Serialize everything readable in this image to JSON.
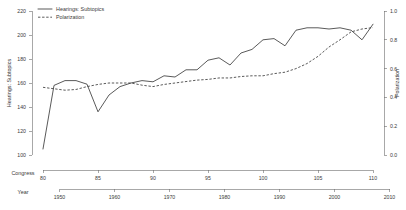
{
  "chart_data": {
    "type": "line",
    "title": "",
    "subtitle": "",
    "grid": false,
    "legend_position": "top-left",
    "xlabel": "Congress",
    "xlabel_secondary": "Year",
    "ylabel": "Hearings: Subtopics",
    "ylabel_secondary": "Polarization",
    "xlim": [
      79,
      110.5
    ],
    "xlim_secondary": [
      1946,
      2010.5
    ],
    "ylim": [
      100,
      220
    ],
    "ylim_secondary": [
      0.0,
      1.0
    ],
    "xticks": [
      80,
      85,
      90,
      95,
      100,
      105,
      110
    ],
    "xticklabels": [
      "80",
      "85",
      "90",
      "95",
      "100",
      "105",
      "110"
    ],
    "xticks_secondary": [
      1950,
      1960,
      1970,
      1980,
      1990,
      2000,
      2010
    ],
    "xticklabels_secondary": [
      "1950",
      "1960",
      "1970",
      "1980",
      "1990",
      "2000",
      "2010"
    ],
    "yticks": [
      100,
      120,
      140,
      160,
      180,
      200,
      220
    ],
    "yticklabels": [
      "100",
      "120",
      "140",
      "160",
      "180",
      "200",
      "220"
    ],
    "yticks_secondary": [
      0.0,
      0.2,
      0.4,
      0.6,
      0.8,
      1.0
    ],
    "yticklabels_secondary": [
      "0.0",
      "0.2",
      "0.4",
      "0.6",
      "0.8",
      "1.0"
    ],
    "line_color": "#3c3c3c",
    "axis_color": "#6e6e6e",
    "series": [
      {
        "name": "Hearings: Subtopics",
        "axis": "left",
        "style": "solid",
        "x": [
          80,
          81,
          82,
          83,
          84,
          85,
          86,
          87,
          88,
          89,
          90,
          91,
          92,
          93,
          94,
          95,
          96,
          97,
          98,
          99,
          100,
          101,
          102,
          103,
          104,
          105,
          106,
          107,
          108,
          109,
          110
        ],
        "values": [
          105,
          158,
          162,
          162,
          159,
          136,
          150,
          157,
          160,
          162,
          161,
          166,
          165,
          171,
          171,
          179,
          181,
          175,
          185,
          188,
          196,
          197,
          191,
          204,
          206,
          206,
          205,
          206,
          204,
          196,
          209
        ]
      },
      {
        "name": "Polarization",
        "axis": "right",
        "style": "dashed",
        "x": [
          80,
          81,
          82,
          83,
          84,
          85,
          86,
          87,
          88,
          89,
          90,
          91,
          92,
          93,
          94,
          95,
          96,
          97,
          98,
          99,
          100,
          101,
          102,
          103,
          104,
          105,
          106,
          107,
          108,
          109,
          110
        ],
        "values": [
          0.47,
          0.46,
          0.45,
          0.46,
          0.48,
          0.49,
          0.5,
          0.5,
          0.5,
          0.49,
          0.48,
          0.49,
          0.5,
          0.51,
          0.52,
          0.53,
          0.54,
          0.54,
          0.55,
          0.55,
          0.55,
          0.56,
          0.56,
          0.56,
          0.57,
          0.57,
          0.58,
          0.6,
          0.63,
          0.66,
          0.7
        ]
      }
    ],
    "series_dashed_override": {
      "note": "dashed series rises steeply after congress 100",
      "values": [
        0.47,
        0.46,
        0.45,
        0.455,
        0.475,
        0.49,
        0.5,
        0.5,
        0.5,
        0.485,
        0.475,
        0.49,
        0.5,
        0.51,
        0.52,
        0.525,
        0.535,
        0.535,
        0.545,
        0.55,
        0.55,
        0.565,
        0.575,
        0.6,
        0.635,
        0.685,
        0.75,
        0.8,
        0.855,
        0.875,
        0.885
      ]
    },
    "legend": [
      {
        "label": "Hearings: Subtopics",
        "style": "solid"
      },
      {
        "label": "Polarization",
        "style": "dashed"
      }
    ],
    "annotations": []
  }
}
